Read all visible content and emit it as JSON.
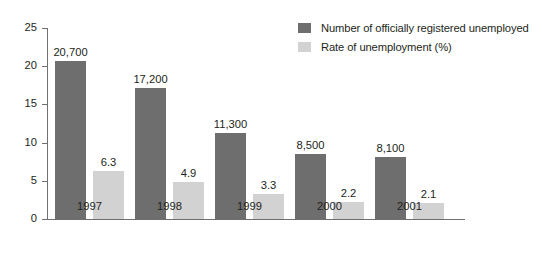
{
  "chart_data": {
    "type": "bar",
    "title": "",
    "subtitle": "",
    "xlabel": "",
    "ylabel": "",
    "ylim": [
      0,
      25
    ],
    "yticks": [
      "0",
      "5",
      "10",
      "15",
      "20",
      "25"
    ],
    "grid": false,
    "legend_position": "top-right",
    "categories": [
      "1997",
      "1998",
      "1999",
      "2000",
      "2001"
    ],
    "series": [
      {
        "name": "Number of officially registered unemployed",
        "color": "#6e6e6e",
        "values": [
          20700,
          17200,
          11300,
          8500,
          8100
        ],
        "plotted_values": [
          20.7,
          17.2,
          11.3,
          8.5,
          8.1
        ],
        "labels": [
          "20,700",
          "17,200",
          "11,300",
          "8,500",
          "8,100"
        ]
      },
      {
        "name": "Rate of unemployment (%)",
        "color": "#d2d2d2",
        "values": [
          6.3,
          4.9,
          3.3,
          2.2,
          2.1
        ],
        "plotted_values": [
          6.3,
          4.9,
          3.3,
          2.2,
          2.1
        ],
        "labels": [
          "6.3",
          "4.9",
          "3.3",
          "2.2",
          "2.1"
        ]
      }
    ]
  },
  "legend": {
    "items": [
      {
        "label": "Number of officially registered unemployed",
        "color": "#6e6e6e"
      },
      {
        "label": "Rate of unemployment (%)",
        "color": "#d2d2d2"
      }
    ]
  },
  "axis": {
    "y_ticks": [
      {
        "label": "25",
        "value": 25
      },
      {
        "label": "20",
        "value": 20
      },
      {
        "label": "15",
        "value": 15
      },
      {
        "label": "10",
        "value": 10
      },
      {
        "label": "5",
        "value": 5
      },
      {
        "label": "0",
        "value": 0
      }
    ],
    "x_labels": [
      "1997",
      "1998",
      "1999",
      "2000",
      "2001"
    ]
  }
}
